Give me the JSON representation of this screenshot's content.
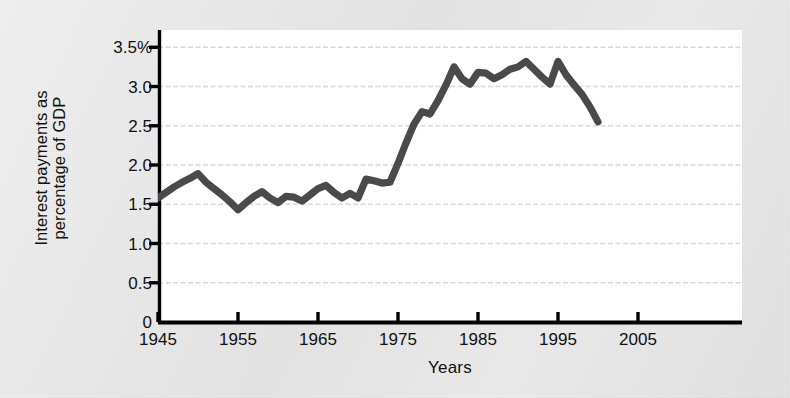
{
  "figure": {
    "background_color": "#eaeaea",
    "plot_background_color": "#ffffff",
    "line_color": "#4a4a4a",
    "axis_color": "#000000",
    "gridline_color": "#d8d8d8"
  },
  "chart_data": {
    "type": "line",
    "title": "",
    "xlabel": "Years",
    "ylabel": "Interest payments as percentage of GDP",
    "ylabel_line1": "Interest payments as",
    "ylabel_line2": "percentage of GDP",
    "xlim": [
      1945,
      2007
    ],
    "ylim": [
      0,
      3.7
    ],
    "grid": true,
    "grid_axis": "y",
    "legend": "none",
    "xticks": [
      1945,
      1955,
      1965,
      1975,
      1985,
      1995,
      2005
    ],
    "xtick_labels": [
      "1945",
      "1955",
      "1965",
      "1975",
      "1985",
      "1995",
      "2005"
    ],
    "yticks": [
      0,
      0.5,
      1.0,
      1.5,
      2.0,
      2.5,
      3.0,
      3.5
    ],
    "ytick_labels": [
      "0",
      "0.5",
      "1.0",
      "1.5",
      "2.0",
      "2.5",
      "3.0",
      "3.5%"
    ],
    "series": [
      {
        "name": "Interest payments as percentage of GDP",
        "x": [
          1945,
          1946,
          1947,
          1948,
          1949,
          1950,
          1951,
          1952,
          1953,
          1954,
          1955,
          1956,
          1957,
          1958,
          1959,
          1960,
          1961,
          1962,
          1963,
          1964,
          1965,
          1966,
          1967,
          1968,
          1969,
          1970,
          1971,
          1972,
          1973,
          1974,
          1975,
          1976,
          1977,
          1978,
          1979,
          1980,
          1981,
          1982,
          1983,
          1984,
          1985,
          1986,
          1987,
          1988,
          1989,
          1990,
          1991,
          1992,
          1993,
          1994,
          1995,
          1996,
          1997,
          1998,
          1999,
          2000
        ],
        "values": [
          1.58,
          1.65,
          1.72,
          1.78,
          1.83,
          1.89,
          1.78,
          1.7,
          1.62,
          1.53,
          1.43,
          1.52,
          1.6,
          1.66,
          1.58,
          1.52,
          1.6,
          1.59,
          1.54,
          1.62,
          1.7,
          1.74,
          1.65,
          1.58,
          1.64,
          1.58,
          1.82,
          1.8,
          1.77,
          1.78,
          2.02,
          2.28,
          2.52,
          2.68,
          2.65,
          2.82,
          3.02,
          3.25,
          3.1,
          3.03,
          3.18,
          3.17,
          3.1,
          3.15,
          3.22,
          3.25,
          3.32,
          3.22,
          3.12,
          3.03,
          3.32,
          3.15,
          3.02,
          2.9,
          2.74,
          2.55
        ]
      }
    ]
  },
  "plot_geometry": {
    "left_px": 158,
    "right_px": 742,
    "top_px": 30,
    "bottom_px": 322,
    "y_value_at_bottom": 0,
    "y_value_at_top": 3.72,
    "x_value_at_left": 1945,
    "x_value_at_right": 2018
  }
}
